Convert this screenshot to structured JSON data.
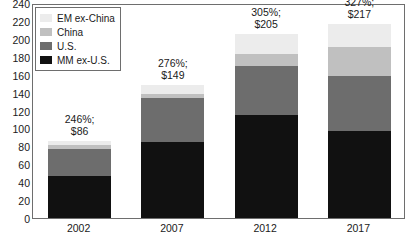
{
  "chart_data": {
    "type": "bar",
    "subtype": "stacked-bar",
    "title": "",
    "subtitle": "",
    "xlabel": "",
    "ylabel": "",
    "categories": [
      "2002",
      "2007",
      "2012",
      "2017"
    ],
    "ylim": [
      0,
      240
    ],
    "ytick_step": 20,
    "yticks": [
      "240",
      "220",
      "200",
      "180",
      "160",
      "140",
      "120",
      "100",
      "80",
      "60",
      "40",
      "20",
      "0"
    ],
    "grid": false,
    "legend_position": "top-left",
    "series": [
      {
        "name": "MM ex-U.S.",
        "color": "#111111",
        "values": [
          47,
          85,
          115,
          97
        ]
      },
      {
        "name": "U.S.",
        "color": "#6d6d6d",
        "values": [
          30,
          49,
          55,
          62
        ]
      },
      {
        "name": "China",
        "color": "#c0c0c0",
        "values": [
          4,
          5,
          13,
          32
        ]
      },
      {
        "name": "EM ex-China",
        "color": "#ececec",
        "values": [
          5,
          10,
          22,
          26
        ]
      }
    ],
    "stack_order_bottom_to_top": [
      "MM ex-U.S.",
      "U.S.",
      "China",
      "EM ex-China"
    ],
    "totals": [
      86,
      149,
      205,
      217
    ],
    "annotations": [
      {
        "category": "2002",
        "line1": "246%;",
        "line2": "$86"
      },
      {
        "category": "2007",
        "line1": "276%;",
        "line2": "$149"
      },
      {
        "category": "2012",
        "line1": "305%;",
        "line2": "$205"
      },
      {
        "category": "2017",
        "line1": "327%;",
        "line2": "$217"
      }
    ]
  },
  "legend": {
    "items": [
      {
        "label": "EM ex-China",
        "color": "#ececec"
      },
      {
        "label": "China",
        "color": "#c0c0c0"
      },
      {
        "label": "U.S.",
        "color": "#6d6d6d"
      },
      {
        "label": "MM ex-U.S.",
        "color": "#111111"
      }
    ]
  },
  "axis": {
    "y_ticks": [
      "240",
      "220",
      "200",
      "180",
      "160",
      "140",
      "120",
      "100",
      "80",
      "60",
      "40",
      "20",
      "0"
    ],
    "x_ticks": [
      "2002",
      "2007",
      "2012",
      "2017"
    ]
  }
}
